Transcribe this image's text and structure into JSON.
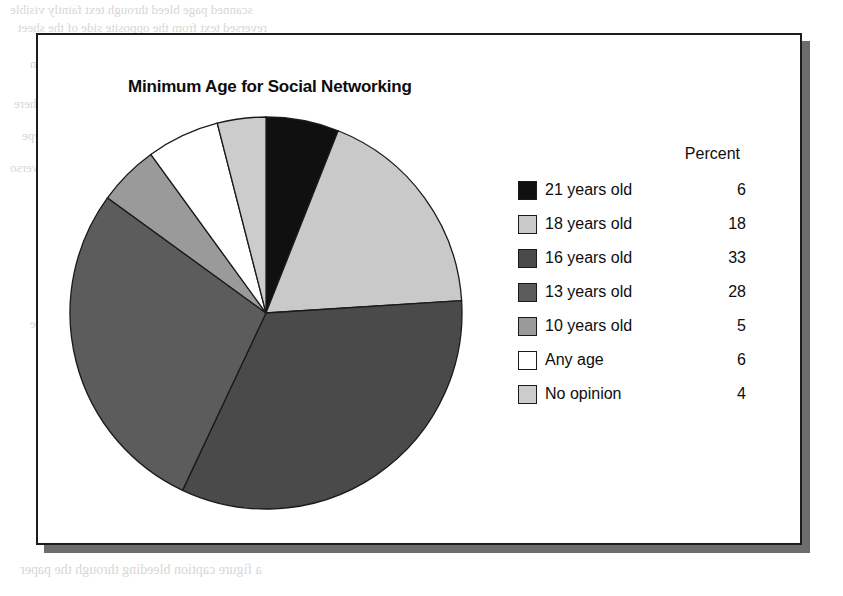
{
  "figure": {
    "title": "Minimum Age for Social Networking"
  },
  "legend": {
    "value_header": "Percent"
  },
  "background_bleed": {
    "line1": "scanned page bleed through text faintly visible",
    "line2": "reversed text from the opposite side of the sheet",
    "line3": "paragraph continues across the upper page margin",
    "line4": "additional ghosted characters appear here",
    "line5": "another faint row of mirrored type",
    "line6": "light show-through from the printed verso",
    "line7": "mirrored body copy beneath the figure box",
    "line8": "more ghost text in the middle region",
    "line9": "barely legible reversed sentence fragment",
    "line10": "continuing show-through of the back page",
    "line11": "final faint line in the middle band",
    "heading_ghost": "Formatting Tables, Bar Charts, and Pie Charts",
    "line_bottom": "a figure caption bleeding through the paper"
  },
  "chart_data": {
    "type": "pie",
    "title": "Minimum Age for Social Networking",
    "value_header": "Percent",
    "unit": "percent",
    "start_angle": 0,
    "direction": "clockwise",
    "categories": [
      "21 years old",
      "18 years old",
      "16 years old",
      "13 years old",
      "10 years old",
      "Any age",
      "No opinion"
    ],
    "values": [
      6,
      18,
      33,
      28,
      5,
      6,
      4
    ],
    "colors": [
      "#101010",
      "#c9c9c9",
      "#4a4a4a",
      "#5c5c5c",
      "#9a9a9a",
      "#ffffff",
      "#cccccc"
    ],
    "slices": [
      {
        "label": "21 years old",
        "value": 6,
        "color": "#101010",
        "swatch_name": "swatch-black"
      },
      {
        "label": "18 years old",
        "value": 18,
        "color": "#c9c9c9",
        "swatch_name": "swatch-light-gray"
      },
      {
        "label": "16 years old",
        "value": 33,
        "color": "#4a4a4a",
        "swatch_name": "swatch-dark-gray"
      },
      {
        "label": "13 years old",
        "value": 28,
        "color": "#5c5c5c",
        "swatch_name": "swatch-medium-dark-gray"
      },
      {
        "label": "10 years old",
        "value": 5,
        "color": "#9a9a9a",
        "swatch_name": "swatch-medium-gray"
      },
      {
        "label": "Any age",
        "value": 6,
        "color": "#ffffff",
        "swatch_name": "swatch-white"
      },
      {
        "label": "No opinion",
        "value": 4,
        "color": "#cccccc",
        "swatch_name": "swatch-pale-gray"
      }
    ],
    "total": 100,
    "legend_position": "right",
    "grid": false
  }
}
